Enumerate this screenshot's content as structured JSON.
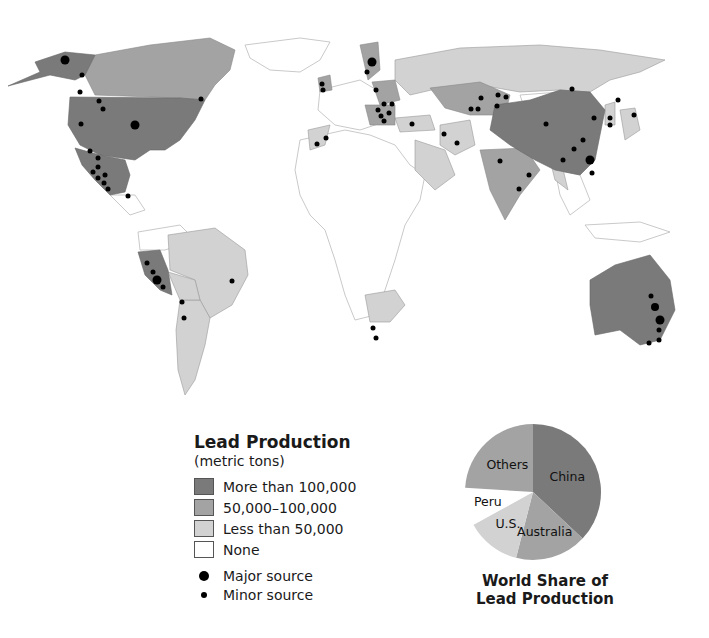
{
  "legend": {
    "title": "Lead Production",
    "subtitle": "(metric tons)",
    "categories": [
      {
        "label": "More than 100,000",
        "color": "#7a7a7a"
      },
      {
        "label": "50,000–100,000",
        "color": "#a3a3a3"
      },
      {
        "label": "Less than 50,000",
        "color": "#d2d2d2"
      },
      {
        "label": "None",
        "color": "#ffffff"
      }
    ],
    "sources": [
      {
        "label": "Major source",
        "size": 10
      },
      {
        "label": "Minor source",
        "size": 6
      }
    ]
  },
  "pie": {
    "title_line1": "World Share of",
    "title_line2": "Lead Production"
  },
  "chart_data": {
    "type": "pie",
    "title": "World Share of Lead Production",
    "categories": [
      "China",
      "Australia",
      "U.S.",
      "Peru",
      "Others"
    ],
    "values": [
      37,
      17,
      13,
      9,
      24
    ],
    "colors": [
      "#7a7a7a",
      "#a3a3a3",
      "#d2d2d2",
      "#ffffff",
      "#a3a3a3"
    ],
    "map_legend": {
      "title": "Lead Production (metric tons)",
      "categories": [
        "More than 100,000",
        "50,000–100,000",
        "Less than 50,000",
        "None"
      ],
      "markers": [
        "Major source",
        "Minor source"
      ]
    },
    "regions": {
      "more_than_100000": [
        "United States",
        "Mexico",
        "Peru",
        "China",
        "Australia"
      ],
      "50000_100000": [
        "Canada",
        "India",
        "Kazakhstan",
        "Sweden",
        "Poland",
        "Bulgaria",
        "Ireland"
      ],
      "less_than_50000": [
        "Russia",
        "Brazil",
        "Argentina",
        "Bolivia",
        "South Africa",
        "Iran",
        "Turkey",
        "Saudi Arabia",
        "Morocco",
        "Japan",
        "Korea"
      ]
    }
  }
}
